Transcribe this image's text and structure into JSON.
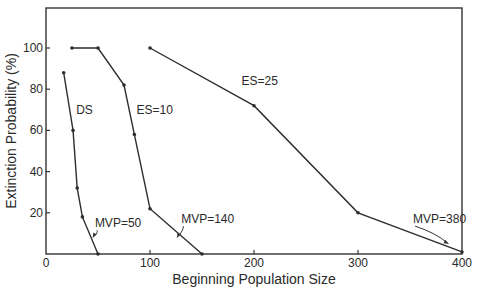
{
  "chart_data": {
    "type": "line",
    "title": "",
    "xlabel": "Beginning Population Size",
    "ylabel": "Extinction Probability (%)",
    "xlim": [
      0,
      400
    ],
    "ylim": [
      0,
      120
    ],
    "xticks": [
      0,
      100,
      200,
      300,
      400
    ],
    "yticks": [
      20,
      40,
      60,
      80,
      100
    ],
    "grid": false,
    "legend": "none (inline labels)",
    "series": [
      {
        "name": "DS",
        "x": [
          17,
          26,
          30,
          35,
          50
        ],
        "y": [
          88,
          60,
          32,
          18,
          0
        ],
        "label_pos": [
          29,
          68
        ],
        "mvp": {
          "label": "MVP=50",
          "value": 50,
          "text_pos": [
            47,
            13
          ],
          "arrow_to": [
            45,
            8
          ]
        }
      },
      {
        "name": "ES=10",
        "x": [
          25,
          50,
          75,
          85,
          100,
          150
        ],
        "y": [
          100,
          100,
          82,
          58,
          22,
          0
        ],
        "label_pos": [
          87,
          68
        ],
        "mvp": {
          "label": "MVP=140",
          "value": 140,
          "text_pos": [
            130,
            15
          ],
          "arrow_to": [
            126,
            8
          ]
        }
      },
      {
        "name": "ES=25",
        "x": [
          100,
          200,
          300,
          400
        ],
        "y": [
          100,
          72,
          20,
          1
        ],
        "label_pos": [
          188,
          82
        ],
        "mvp": {
          "label": "MVP=380",
          "value": 380,
          "text_pos": [
            353,
            15
          ],
          "arrow_to": [
            387,
            5
          ]
        }
      }
    ]
  },
  "labels": {
    "xlabel": "Beginning Population Size",
    "ylabel": "Extinction Probability (%)"
  }
}
